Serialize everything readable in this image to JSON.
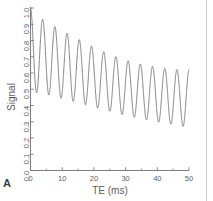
{
  "panel": {
    "letter": "A"
  },
  "chart_data": {
    "type": "line",
    "title": "",
    "xlabel": "TE  (ms)",
    "ylabel": "Signal",
    "xlim": [
      0,
      50
    ],
    "ylim": [
      0.0,
      1.0
    ],
    "grid": false,
    "legend": null,
    "xticks": [
      0,
      10,
      20,
      30,
      40,
      50
    ],
    "xtick_labels": [
      "0",
      "10",
      "20",
      "30",
      "40",
      "50"
    ],
    "xminor_ticks": [
      5,
      15,
      25,
      35,
      45
    ],
    "yticks": [
      0.0,
      0.1,
      0.2,
      0.3,
      0.4,
      0.5,
      0.6,
      0.7,
      0.8,
      0.9,
      1.0
    ],
    "ytick_labels": [
      "0.0",
      "0.1",
      "0.2",
      "0.3",
      "0.4",
      "0.5",
      "0.6",
      "0.7",
      "0.8",
      "0.9",
      "1.0"
    ],
    "line_color": "#6b6b6d",
    "series": [
      {
        "name": "Signal",
        "model": "damped-oscillation",
        "description": "Oscillating signal decay: exponentially decaying mean with exponentially decaying oscillation amplitude",
        "period_ms": 3.85,
        "n_cycles": 13,
        "x": [
          0.0,
          0.4,
          0.8,
          1.2,
          1.6,
          2.0,
          2.4,
          2.8,
          3.2,
          3.6,
          4.0,
          4.4,
          4.8,
          5.2,
          5.6,
          6.0,
          6.4,
          6.8,
          7.2,
          7.6,
          8.0,
          8.4,
          8.8,
          9.2,
          9.6,
          10.0,
          10.4,
          10.8,
          11.2,
          11.6,
          12.0,
          12.4,
          12.8,
          13.2,
          13.6,
          14.0,
          14.4,
          14.8,
          15.2,
          15.6,
          16.0,
          16.4,
          16.8,
          17.2,
          17.6,
          18.0,
          18.4,
          18.8,
          19.2,
          19.6,
          20.0,
          20.4,
          20.8,
          21.2,
          21.6,
          22.0,
          22.4,
          22.8,
          23.2,
          23.6,
          24.0,
          24.4,
          24.8,
          25.2,
          25.6,
          26.0,
          26.4,
          26.8,
          27.2,
          27.6,
          28.0,
          28.4,
          28.8,
          29.2,
          29.6,
          30.0,
          30.4,
          30.8,
          31.2,
          31.6,
          32.0,
          32.4,
          32.8,
          33.2,
          33.6,
          34.0,
          34.4,
          34.8,
          35.2,
          35.6,
          36.0,
          36.4,
          36.8,
          37.2,
          37.6,
          38.0,
          38.4,
          38.8,
          39.2,
          39.6,
          40.0,
          40.4,
          40.8,
          41.2,
          41.6,
          42.0,
          42.4,
          42.8,
          43.2,
          43.6,
          44.0,
          44.4,
          44.8,
          45.2,
          45.6,
          46.0,
          46.4,
          46.8,
          47.2,
          47.6,
          48.0,
          48.4,
          48.8,
          49.2,
          49.6,
          50.0
        ],
        "envelope_max": [
          1.0,
          0.955,
          0.935,
          0.92,
          0.905,
          0.89,
          0.875,
          0.86,
          0.845,
          0.83,
          0.815,
          0.8,
          0.785,
          0.77,
          0.755,
          0.74,
          0.725,
          0.712,
          0.7,
          0.69,
          0.68,
          0.67,
          0.66,
          0.652,
          0.645,
          0.638
        ],
        "envelope_min": [
          0.48,
          0.47,
          0.46,
          0.45,
          0.44,
          0.43,
          0.42,
          0.41,
          0.4,
          0.39,
          0.38,
          0.368,
          0.356,
          0.345,
          0.335,
          0.325,
          0.316,
          0.308,
          0.3,
          0.293,
          0.287,
          0.281,
          0.276,
          0.272,
          0.268,
          0.265
        ],
        "peaks_te": [
          0.0,
          3.85,
          7.7,
          11.55,
          15.4,
          19.25,
          23.1,
          26.95,
          30.8,
          34.65,
          38.5,
          42.35,
          46.2
        ],
        "peaks_value": [
          1.0,
          0.93,
          0.885,
          0.845,
          0.805,
          0.765,
          0.73,
          0.7,
          0.675,
          0.655,
          0.64,
          0.628,
          0.62
        ],
        "troughs_te": [
          1.92,
          5.77,
          9.62,
          13.47,
          17.32,
          21.17,
          25.02,
          28.87,
          32.72,
          36.57,
          40.42,
          44.27,
          48.12
        ],
        "troughs_value": [
          0.48,
          0.465,
          0.445,
          0.425,
          0.405,
          0.385,
          0.365,
          0.345,
          0.328,
          0.312,
          0.298,
          0.285,
          0.272
        ]
      }
    ]
  }
}
